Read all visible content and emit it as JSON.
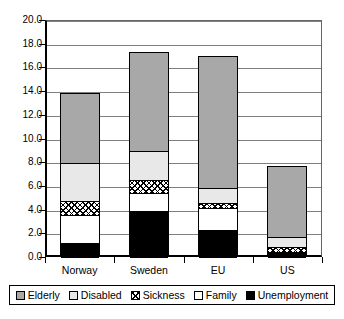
{
  "chart_data": {
    "type": "bar",
    "subtype": "stacked-bar",
    "title": "",
    "xlabel": "",
    "ylabel": "",
    "categories": [
      "Norway",
      "Sweden",
      "EU",
      "US"
    ],
    "ylim": [
      0.0,
      20.0
    ],
    "ytick_step": 2.0,
    "ytick_labels": [
      "0.0",
      "2.0",
      "4.0",
      "6.0",
      "8.0",
      "10.0",
      "12.0",
      "14.0",
      "16.0",
      "18.0",
      "20.0"
    ],
    "ytick_values": [
      0.0,
      2.0,
      4.0,
      6.0,
      8.0,
      10.0,
      12.0,
      14.0,
      16.0,
      18.0,
      20.0
    ],
    "grid": true,
    "grid_axis": "y",
    "legend_position": "bottom",
    "stack_order_bottom_to_top": [
      "Unemployment",
      "Family",
      "Sickness",
      "Disabled",
      "Elderly"
    ],
    "series": [
      {
        "name": "Elderly",
        "color": "#a8a8a8",
        "pattern": "solid-gray",
        "values": [
          5.8,
          8.3,
          11.1,
          5.9
        ]
      },
      {
        "name": "Disabled",
        "color": "#e8e8e8",
        "pattern": "light-gray",
        "values": [
          3.2,
          2.4,
          1.3,
          0.9
        ]
      },
      {
        "name": "Sickness",
        "color": "#ffffff",
        "pattern": "crosshatch",
        "values": [
          1.2,
          1.1,
          0.4,
          0.4
        ]
      },
      {
        "name": "Family",
        "color": "#ffffff",
        "pattern": "white",
        "values": [
          2.3,
          1.5,
          1.8,
          0.1
        ]
      },
      {
        "name": "Unemployment",
        "color": "#000000",
        "pattern": "solid-black",
        "values": [
          1.3,
          4.0,
          2.4,
          0.4
        ]
      }
    ],
    "totals": [
      13.8,
      17.3,
      17.0,
      7.7
    ]
  },
  "legend": {
    "items": [
      {
        "label": "Elderly",
        "swatch": "swatch-elderly"
      },
      {
        "label": "Disabled",
        "swatch": "swatch-disabled"
      },
      {
        "label": "Sickness",
        "swatch": "swatch-sickness"
      },
      {
        "label": "Family",
        "swatch": "swatch-family"
      },
      {
        "label": "Unemployment",
        "swatch": "swatch-unemployment"
      }
    ]
  }
}
